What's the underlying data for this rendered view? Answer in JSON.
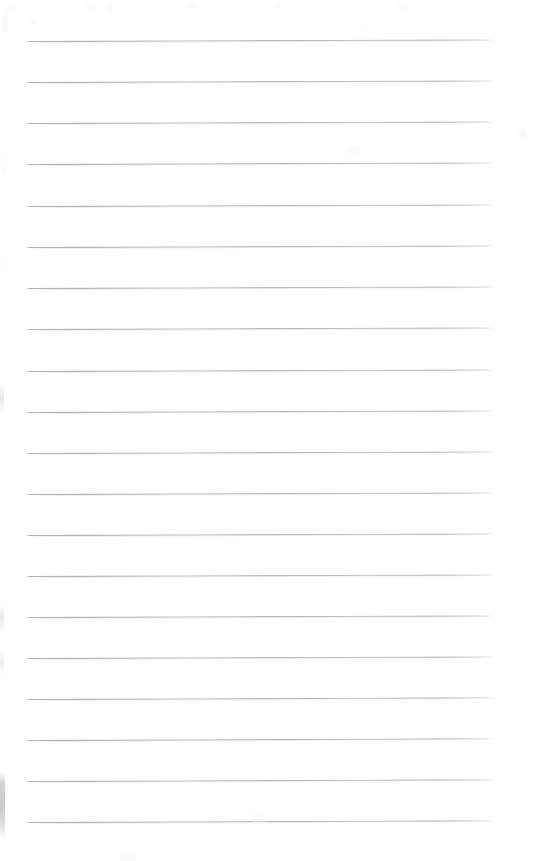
{
  "document": {
    "kind": "scanned-lined-notepad-page",
    "title": "Blank Ruled Notepad Page",
    "page_width_px": 534,
    "page_height_px": 861,
    "background_color": "#ffffff",
    "paper_tint_color": "#fdfdfd",
    "has_text_content": false,
    "text_content": "",
    "orientation": "portrait"
  },
  "ruling": {
    "type": "horizontal-ruled",
    "line_color": "#a8a8aa",
    "line_shadow_color": "#c8c8cc",
    "line_count": 20,
    "line_thickness_px": 1,
    "left_margin_px": 26,
    "right_margin_px": 39,
    "line_length_px": 469,
    "first_line_y_px": 41,
    "last_line_y_px": 822,
    "line_spacing_px": 41.1,
    "skew_degrees": -0.18,
    "lines": [
      {
        "index": 1,
        "y": 41,
        "x_start": 26,
        "x_end": 495,
        "skew_px": -1.6
      },
      {
        "index": 2,
        "y": 82,
        "x_start": 26,
        "x_end": 495,
        "skew_px": -1.6
      },
      {
        "index": 3,
        "y": 123,
        "x_start": 26,
        "x_end": 495,
        "skew_px": -1.5
      },
      {
        "index": 4,
        "y": 164,
        "x_start": 26,
        "x_end": 495,
        "skew_px": -1.5
      },
      {
        "index": 5,
        "y": 206,
        "x_start": 26,
        "x_end": 495,
        "skew_px": -1.5
      },
      {
        "index": 6,
        "y": 247,
        "x_start": 26,
        "x_end": 495,
        "skew_px": -1.4
      },
      {
        "index": 7,
        "y": 288,
        "x_start": 26,
        "x_end": 495,
        "skew_px": -1.4
      },
      {
        "index": 8,
        "y": 329,
        "x_start": 26,
        "x_end": 495,
        "skew_px": -1.4
      },
      {
        "index": 9,
        "y": 371,
        "x_start": 26,
        "x_end": 495,
        "skew_px": -1.5
      },
      {
        "index": 10,
        "y": 412,
        "x_start": 26,
        "x_end": 495,
        "skew_px": -1.5
      },
      {
        "index": 11,
        "y": 453,
        "x_start": 26,
        "x_end": 495,
        "skew_px": -1.5
      },
      {
        "index": 12,
        "y": 494,
        "x_start": 26,
        "x_end": 495,
        "skew_px": -1.5
      },
      {
        "index": 13,
        "y": 535,
        "x_start": 26,
        "x_end": 495,
        "skew_px": -1.5
      },
      {
        "index": 14,
        "y": 576,
        "x_start": 26,
        "x_end": 495,
        "skew_px": -1.6
      },
      {
        "index": 15,
        "y": 617,
        "x_start": 26,
        "x_end": 495,
        "skew_px": -1.6
      },
      {
        "index": 16,
        "y": 658,
        "x_start": 26,
        "x_end": 495,
        "skew_px": -1.6
      },
      {
        "index": 17,
        "y": 699,
        "x_start": 26,
        "x_end": 495,
        "skew_px": -1.7
      },
      {
        "index": 18,
        "y": 740,
        "x_start": 26,
        "x_end": 495,
        "skew_px": -1.7
      },
      {
        "index": 19,
        "y": 781,
        "x_start": 26,
        "x_end": 495,
        "skew_px": -1.7
      },
      {
        "index": 20,
        "y": 822,
        "x_start": 26,
        "x_end": 495,
        "skew_px": -1.7
      }
    ]
  },
  "artifacts": {
    "description": "faint scanner edge smudges and near-white specks",
    "smudges": [
      {
        "name": "left-lower",
        "x": 0,
        "y": 772,
        "w": 5,
        "h": 66,
        "color": "#b0b0b4"
      },
      {
        "name": "left-mid-a",
        "x": 0,
        "y": 382,
        "w": 4,
        "h": 34,
        "color": "#c4c4c8"
      },
      {
        "name": "left-mid-b",
        "x": 0,
        "y": 604,
        "w": 4,
        "h": 30,
        "color": "#c6c6ca"
      },
      {
        "name": "left-mid-c",
        "x": 0,
        "y": 648,
        "w": 4,
        "h": 28,
        "color": "#c8c8cc"
      }
    ],
    "specks": [
      {
        "x": 4,
        "y": 3,
        "w": 14,
        "h": 10
      },
      {
        "x": 86,
        "y": 2,
        "w": 10,
        "h": 9
      },
      {
        "x": 106,
        "y": 4,
        "w": 8,
        "h": 7
      },
      {
        "x": 186,
        "y": 2,
        "w": 12,
        "h": 8
      },
      {
        "x": 274,
        "y": 3,
        "w": 9,
        "h": 8
      },
      {
        "x": 398,
        "y": 2,
        "w": 11,
        "h": 9
      },
      {
        "x": 2,
        "y": 16,
        "w": 6,
        "h": 18
      },
      {
        "x": 30,
        "y": 18,
        "w": 7,
        "h": 7
      },
      {
        "x": 358,
        "y": 24,
        "w": 10,
        "h": 7
      },
      {
        "x": 2,
        "y": 148,
        "w": 5,
        "h": 26
      },
      {
        "x": 348,
        "y": 146,
        "w": 12,
        "h": 10
      },
      {
        "x": 518,
        "y": 128,
        "w": 10,
        "h": 12
      },
      {
        "x": 2,
        "y": 252,
        "w": 5,
        "h": 22
      },
      {
        "x": 252,
        "y": 812,
        "w": 14,
        "h": 10
      },
      {
        "x": 120,
        "y": 852,
        "w": 16,
        "h": 8
      }
    ]
  }
}
